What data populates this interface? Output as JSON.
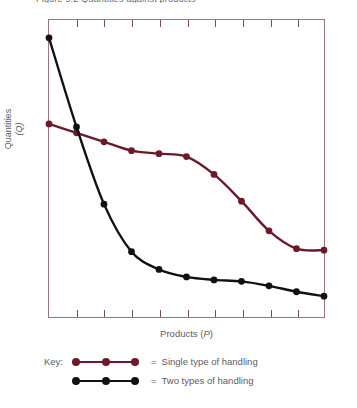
{
  "top_caption_fragment": "Figure 9.2   Quantities against products",
  "axes": {
    "ylabel_main": "Quantities",
    "ylabel_sub": "(Q)",
    "xlabel_text": "Products (",
    "xlabel_symbol": "P",
    "xlabel_close": ")"
  },
  "key": {
    "label": "Key:",
    "equals": "=",
    "rows": [
      {
        "text": "Single type of handling",
        "color": "#6b1a2a"
      },
      {
        "text": "Two types of handling",
        "color": "#111111"
      }
    ]
  },
  "colors": {
    "frame": "#9b7480",
    "tick": "#7d4a58",
    "series_single": "#6b1a2a",
    "series_two": "#111111",
    "text": "#5c5d5f"
  },
  "chart_data": {
    "type": "line",
    "title": "",
    "xlabel": "Products (P)",
    "ylabel": "Quantities (Q)",
    "grid": false,
    "legend_position": "below",
    "xlim": [
      0,
      10
    ],
    "ylim": [
      0,
      10
    ],
    "x_ticks": [
      0,
      1,
      2,
      3,
      4,
      5,
      6,
      7,
      8,
      9,
      10
    ],
    "x_tick_labels": [],
    "y_tick_labels": [],
    "x": [
      0,
      1,
      2,
      3,
      4,
      5,
      6,
      7,
      8,
      9,
      10
    ],
    "series": [
      {
        "name": "Single type of handling",
        "color": "#6b1a2a",
        "values": [
          6.5,
          6.2,
          5.9,
          5.6,
          5.5,
          5.4,
          4.8,
          3.9,
          2.9,
          2.3,
          2.25
        ]
      },
      {
        "name": "Two types of handling",
        "color": "#111111",
        "values": [
          9.4,
          6.4,
          3.8,
          2.2,
          1.6,
          1.35,
          1.25,
          1.2,
          1.05,
          0.85,
          0.7
        ]
      }
    ]
  }
}
